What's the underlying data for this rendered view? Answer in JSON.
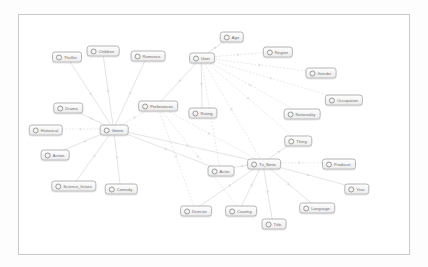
{
  "canvas": {
    "title": "ontology-graph-canvas",
    "background": "#ffffff",
    "border_color": "#c9c9c9",
    "node_fill": "#ececec",
    "node_border": "#b4b4b4",
    "edge_color": "#cdcdcd",
    "label_color": "#6d6d6d"
  },
  "graph": {
    "type": "node-link-diagram",
    "node_icon": "circle-node-icon",
    "nodes": [
      {
        "id": "thriller",
        "label": "Thriller",
        "x": 48,
        "y": 42,
        "role": "leaf"
      },
      {
        "id": "children",
        "label": "Children",
        "x": 84,
        "y": 36,
        "role": "leaf"
      },
      {
        "id": "romance",
        "label": "Romance",
        "x": 129,
        "y": 41,
        "role": "leaf"
      },
      {
        "id": "drama",
        "label": "Drama",
        "x": 49,
        "y": 93,
        "role": "leaf"
      },
      {
        "id": "historical",
        "label": "Historical",
        "x": 27,
        "y": 115,
        "role": "leaf"
      },
      {
        "id": "action",
        "label": "Action",
        "x": 36,
        "y": 140,
        "role": "leaf"
      },
      {
        "id": "science_fiction",
        "label": "Science_fiction",
        "x": 55,
        "y": 171,
        "role": "leaf"
      },
      {
        "id": "comedy",
        "label": "Comedy",
        "x": 102,
        "y": 174,
        "role": "leaf"
      },
      {
        "id": "genre",
        "label": "Genre",
        "x": 95,
        "y": 115,
        "role": "hub"
      },
      {
        "id": "preferences",
        "label": "Preferences",
        "x": 139,
        "y": 91,
        "role": "hub"
      },
      {
        "id": "user",
        "label": "User",
        "x": 183,
        "y": 43,
        "role": "hub"
      },
      {
        "id": "age",
        "label": "Age",
        "x": 213,
        "y": 22,
        "role": "leaf"
      },
      {
        "id": "region",
        "label": "Region",
        "x": 259,
        "y": 37,
        "role": "leaf"
      },
      {
        "id": "gender",
        "label": "Gender",
        "x": 302,
        "y": 58,
        "role": "leaf"
      },
      {
        "id": "occupation",
        "label": "Occupation",
        "x": 325,
        "y": 85,
        "role": "leaf"
      },
      {
        "id": "rating",
        "label": "Rating",
        "x": 184,
        "y": 98,
        "role": "leaf"
      },
      {
        "id": "nationality",
        "label": "Nationality",
        "x": 283,
        "y": 99,
        "role": "leaf"
      },
      {
        "id": "thing",
        "label": "Thing",
        "x": 279,
        "y": 126,
        "role": "leaf"
      },
      {
        "id": "tv_serie",
        "label": "Tv_Serie",
        "x": 245,
        "y": 149,
        "role": "hub"
      },
      {
        "id": "producer",
        "label": "Producer",
        "x": 320,
        "y": 149,
        "role": "leaf"
      },
      {
        "id": "actor",
        "label": "Actor",
        "x": 202,
        "y": 156,
        "role": "leaf"
      },
      {
        "id": "year",
        "label": "Year",
        "x": 338,
        "y": 174,
        "role": "leaf"
      },
      {
        "id": "language",
        "label": "Language",
        "x": 298,
        "y": 193,
        "role": "leaf"
      },
      {
        "id": "country",
        "label": "Country",
        "x": 222,
        "y": 196,
        "role": "leaf"
      },
      {
        "id": "director",
        "label": "Director",
        "x": 177,
        "y": 196,
        "role": "leaf"
      },
      {
        "id": "title",
        "label": "Title",
        "x": 255,
        "y": 209,
        "role": "leaf"
      }
    ],
    "edges": [
      {
        "from": "genre",
        "to": "thriller",
        "style": "solid"
      },
      {
        "from": "genre",
        "to": "children",
        "style": "solid"
      },
      {
        "from": "genre",
        "to": "romance",
        "style": "solid"
      },
      {
        "from": "genre",
        "to": "drama",
        "style": "solid"
      },
      {
        "from": "genre",
        "to": "historical",
        "style": "dashed"
      },
      {
        "from": "genre",
        "to": "action",
        "style": "solid"
      },
      {
        "from": "genre",
        "to": "science_fiction",
        "style": "solid"
      },
      {
        "from": "genre",
        "to": "comedy",
        "style": "solid"
      },
      {
        "from": "genre",
        "to": "preferences",
        "style": "dashed"
      },
      {
        "from": "genre",
        "to": "tv_serie",
        "style": "solid"
      },
      {
        "from": "genre",
        "to": "actor",
        "style": "solid"
      },
      {
        "from": "user",
        "to": "age",
        "style": "solid"
      },
      {
        "from": "user",
        "to": "region",
        "style": "dashed"
      },
      {
        "from": "user",
        "to": "gender",
        "style": "dashed"
      },
      {
        "from": "user",
        "to": "occupation",
        "style": "dashed"
      },
      {
        "from": "user",
        "to": "rating",
        "style": "solid"
      },
      {
        "from": "user",
        "to": "nationality",
        "style": "dashed"
      },
      {
        "from": "user",
        "to": "thing",
        "style": "dashed"
      },
      {
        "from": "user",
        "to": "preferences",
        "style": "solid"
      },
      {
        "from": "user",
        "to": "tv_serie",
        "style": "dashed"
      },
      {
        "from": "user",
        "to": "actor",
        "style": "dashed"
      },
      {
        "from": "preferences",
        "to": "director",
        "style": "dashed"
      },
      {
        "from": "preferences",
        "to": "country",
        "style": "dashed"
      },
      {
        "from": "preferences",
        "to": "tv_serie",
        "style": "dashed"
      },
      {
        "from": "tv_serie",
        "to": "producer",
        "style": "dashed"
      },
      {
        "from": "tv_serie",
        "to": "year",
        "style": "solid"
      },
      {
        "from": "tv_serie",
        "to": "language",
        "style": "solid"
      },
      {
        "from": "tv_serie",
        "to": "country",
        "style": "solid"
      },
      {
        "from": "tv_serie",
        "to": "director",
        "style": "solid"
      },
      {
        "from": "tv_serie",
        "to": "title",
        "style": "solid"
      },
      {
        "from": "tv_serie",
        "to": "actor",
        "style": "solid"
      },
      {
        "from": "tv_serie",
        "to": "thing",
        "style": "solid"
      }
    ]
  }
}
